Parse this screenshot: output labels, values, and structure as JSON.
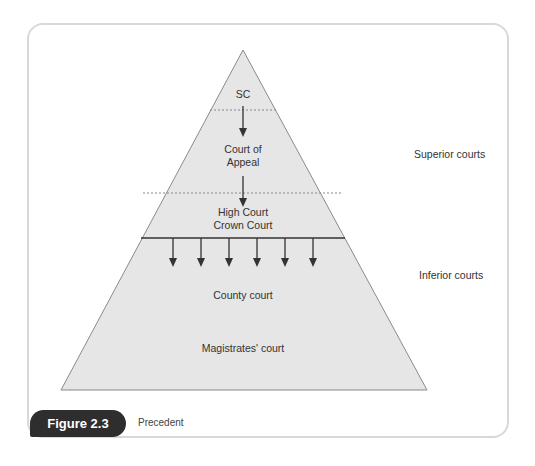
{
  "figure": {
    "label": "Figure 2.3",
    "caption": "Precedent"
  },
  "pyramid": {
    "levels": [
      {
        "id": "sc",
        "label_lines": [
          "SC"
        ]
      },
      {
        "id": "court-of-appeal",
        "label_lines": [
          "Court of",
          "Appeal"
        ]
      },
      {
        "id": "high-crown",
        "label_lines": [
          "High Court",
          "Crown Court"
        ]
      },
      {
        "id": "county",
        "label_lines": [
          "County court"
        ]
      },
      {
        "id": "magistrates",
        "label_lines": [
          "Magistrates' court"
        ]
      }
    ],
    "fill_color": "#e6e6e6",
    "stroke_color": "#8a8a8a",
    "downward_arrows_count": 6
  },
  "side_labels": {
    "superior": "Superior courts",
    "inferior": "Inferior courts"
  }
}
